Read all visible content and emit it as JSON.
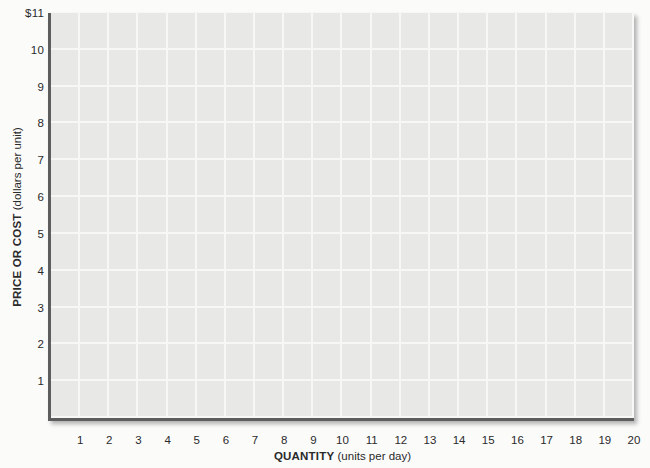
{
  "figure": {
    "page_background": "#fbfbfa"
  },
  "chart_data": {
    "type": "line",
    "title": "",
    "series": [],
    "xlabel": "QUANTITY (units per day)",
    "xlabel_main": "QUANTITY",
    "xlabel_units": " (units per day)",
    "ylabel": "PRICE OR COST (dollars per unit)",
    "ylabel_main": "PRICE OR COST",
    "ylabel_units": " (dollars per unit)",
    "x_ticks": [
      "1",
      "2",
      "3",
      "4",
      "5",
      "6",
      "7",
      "8",
      "9",
      "10",
      "11",
      "12",
      "13",
      "14",
      "15",
      "16",
      "17",
      "18",
      "19",
      "20"
    ],
    "y_ticks_top_to_bottom": [
      "$11",
      "10",
      "9",
      "8",
      "7",
      "6",
      "5",
      "4",
      "3",
      "2",
      "1"
    ],
    "xlim": [
      0,
      20
    ],
    "ylim": [
      0,
      11
    ],
    "grid": true,
    "legend_position": "none",
    "colors": {
      "plot_background": "#e8e8e6",
      "gridline": "#f7f7f5",
      "axis": "#5d5d5d",
      "text": "#2a2a2a",
      "page_background": "#fbfbfa"
    }
  }
}
